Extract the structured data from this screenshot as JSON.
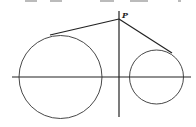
{
  "figure": {
    "point_label": "P",
    "point": {
      "x": 119,
      "y": 19
    },
    "axis_horizontal": {
      "x1": 12,
      "x2": 191,
      "y": 77
    },
    "axis_vertical": {
      "x": 119,
      "y1": 11,
      "y2": 117
    },
    "large_circle": {
      "cx": 60.5,
      "cy": 77,
      "r": 41.5,
      "tangent_point": {
        "x": 50,
        "y": 35
      }
    },
    "small_circle": {
      "cx": 156.5,
      "cy": 77,
      "r": 27,
      "tangent_point": {
        "x": 172,
        "y": 53
      }
    },
    "stroke_color": "#222222"
  }
}
